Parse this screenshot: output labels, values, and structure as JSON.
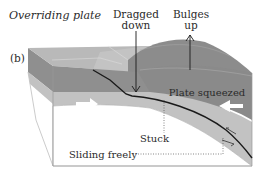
{
  "figure": {
    "panel_label": "(b)",
    "title": "Overriding plate",
    "labels": {
      "dragged_down_line1": "Dragged",
      "dragged_down_line2": "down",
      "bulges_up_line1": "Bulges",
      "bulges_up_line2": "up",
      "plate_squeezed": "Plate squeezed",
      "stuck": "Stuck",
      "sliding_freely": "Sliding freely"
    },
    "colors": {
      "top_face_light": "#b9b9b9",
      "top_face_mid": "#a8a8a8",
      "bulge_dark": "#8c8c8c",
      "front_dark": "#8f8f8f",
      "front_mid": "#a9a9a9",
      "subducting_band": "#c2c2c2",
      "lower_white": "#ffffff",
      "arrow_white": "#ffffff",
      "fault_line": "#1a1a1a",
      "text": "#2b2b2b"
    }
  }
}
